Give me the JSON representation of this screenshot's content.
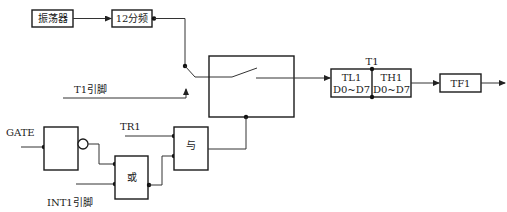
{
  "diagram": {
    "blocks": {
      "oscillator": {
        "label": "振荡器"
      },
      "divider": {
        "label": "12分频"
      },
      "switch_box": {
        "label": ""
      },
      "timer": {
        "title": "T1",
        "low": {
          "name": "TL1",
          "bits": "D0~D7"
        },
        "high": {
          "name": "TH1",
          "bits": "D0~D7"
        }
      },
      "overflow_flag": {
        "label": "TF1"
      },
      "not_gate": {
        "label": ""
      },
      "or_gate": {
        "label": "或"
      },
      "and_gate": {
        "label": "与"
      }
    },
    "inputs": {
      "t1_pin": "T1引脚",
      "gate": "GATE",
      "tr1": "TR1",
      "int1_pin": "INT1引脚"
    },
    "colors": {
      "line": "#333333",
      "box_border": "#1a1a1a",
      "background": "#ffffff"
    }
  }
}
